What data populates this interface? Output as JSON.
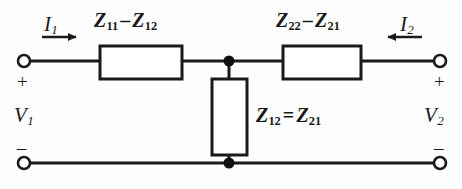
{
  "figure": {
    "name": "two-port-t-equivalent-circuit",
    "colors": {
      "line": "#1a1a1a",
      "background": "#fefefe",
      "node": "#111111"
    }
  },
  "labels": {
    "current_left": {
      "symbol": "I",
      "sub": "1"
    },
    "current_right": {
      "symbol": "I",
      "sub": "2"
    },
    "voltage_left": {
      "symbol": "V",
      "sub": "1"
    },
    "voltage_right": {
      "symbol": "V",
      "sub": "2"
    },
    "series_left": {
      "term1": "Z",
      "term1_sub": "11",
      "operator": "–",
      "term2": "Z",
      "term2_sub": "12"
    },
    "series_right": {
      "term1": "Z",
      "term1_sub": "22",
      "operator": "–",
      "term2": "Z",
      "term2_sub": "21"
    },
    "shunt": {
      "term1": "Z",
      "term1_sub": "12",
      "operator": "=",
      "term2": "Z",
      "term2_sub": "21"
    },
    "polarity_top_left": "+",
    "polarity_top_right": "+",
    "polarity_bottom_left": "–",
    "polarity_bottom_right": "–"
  },
  "elements": {
    "box_series_left": {
      "x": 100,
      "y": 46,
      "w": 82,
      "h": 33
    },
    "box_series_right": {
      "x": 283,
      "y": 46,
      "w": 78,
      "h": 33
    },
    "box_shunt": {
      "x": 212,
      "y": 79,
      "w": 35,
      "h": 76
    },
    "terminal_top_left": {
      "cx": 24,
      "cy": 61,
      "r": 6
    },
    "terminal_top_right": {
      "cx": 440,
      "cy": 61,
      "r": 6
    },
    "terminal_bottom_left": {
      "cx": 24,
      "cy": 163,
      "r": 6
    },
    "terminal_bottom_right": {
      "cx": 440,
      "cy": 163,
      "r": 6
    },
    "node_top": {
      "cx": 229,
      "cy": 61,
      "r": 5
    },
    "node_bottom": {
      "cx": 229,
      "cy": 163,
      "r": 5
    },
    "arrow_left": {
      "x1": 42,
      "y1": 37,
      "x2": 78,
      "y2": 37,
      "direction": "right"
    },
    "arrow_right": {
      "x1": 420,
      "y1": 37,
      "x2": 384,
      "y2": 37,
      "direction": "left"
    },
    "rail_top_y": 61,
    "rail_bottom_y": 163
  }
}
